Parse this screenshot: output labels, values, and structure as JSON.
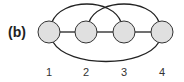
{
  "figure": {
    "panel_label": "(b)",
    "node_fill": "#e0e0e0",
    "stroke_color": "#222222",
    "nodes": [
      {
        "id": "1",
        "label": "1",
        "cx": 49,
        "cy": 32
      },
      {
        "id": "2",
        "label": "2",
        "cx": 86,
        "cy": 32
      },
      {
        "id": "3",
        "label": "3",
        "cx": 124,
        "cy": 32
      },
      {
        "id": "4",
        "label": "4",
        "cx": 162,
        "cy": 32
      }
    ],
    "edges": [
      {
        "from": "1",
        "to": "2",
        "type": "straight"
      },
      {
        "from": "2",
        "to": "3",
        "type": "straight"
      },
      {
        "from": "3",
        "to": "4",
        "type": "straight"
      },
      {
        "from": "1",
        "to": "3",
        "type": "arc-top"
      },
      {
        "from": "2",
        "to": "4",
        "type": "arc-top"
      },
      {
        "from": "1",
        "to": "4",
        "type": "arc-bottom"
      }
    ]
  }
}
